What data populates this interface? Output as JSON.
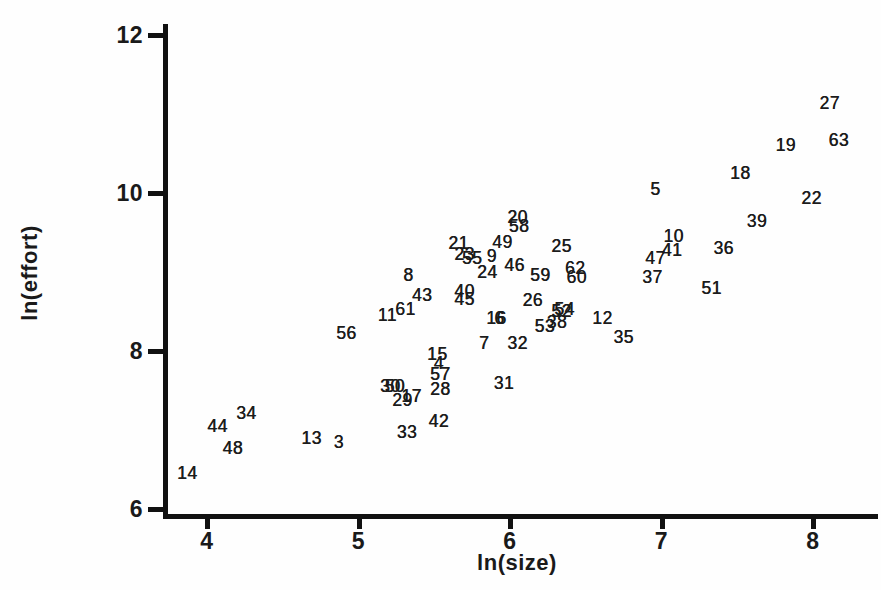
{
  "figure": {
    "background": "#fefefe",
    "ink_color": "#111111",
    "text_color": "#1a1a1a"
  },
  "chart_data": {
    "type": "scatter",
    "title": "",
    "xlabel": "ln(size)",
    "ylabel": "ln(effort)",
    "xlim": [
      3.6,
      8.45
    ],
    "ylim": [
      5.75,
      12.2
    ],
    "x_ticks": [
      4,
      5,
      6,
      7,
      8
    ],
    "y_ticks": [
      6,
      8,
      10,
      12
    ],
    "grid": false,
    "legend": "none",
    "marker_style": "numeric-case-labels",
    "points": [
      {
        "label": "14",
        "x": 3.87,
        "y": 6.46
      },
      {
        "label": "44",
        "x": 4.07,
        "y": 7.05
      },
      {
        "label": "34",
        "x": 4.26,
        "y": 7.22
      },
      {
        "label": "48",
        "x": 4.17,
        "y": 6.77
      },
      {
        "label": "13",
        "x": 4.69,
        "y": 6.9
      },
      {
        "label": "3",
        "x": 4.87,
        "y": 6.85
      },
      {
        "label": "56",
        "x": 4.92,
        "y": 8.23
      },
      {
        "label": "11",
        "x": 5.19,
        "y": 8.46
      },
      {
        "label": "61",
        "x": 5.31,
        "y": 8.53
      },
      {
        "label": "8",
        "x": 5.33,
        "y": 8.96
      },
      {
        "label": "43",
        "x": 5.42,
        "y": 8.71
      },
      {
        "label": "30",
        "x": 5.21,
        "y": 7.56
      },
      {
        "label": "50",
        "x": 5.24,
        "y": 7.56
      },
      {
        "label": "29",
        "x": 5.29,
        "y": 7.38
      },
      {
        "label": "17",
        "x": 5.35,
        "y": 7.43
      },
      {
        "label": "33",
        "x": 5.32,
        "y": 6.97
      },
      {
        "label": "42",
        "x": 5.53,
        "y": 7.11
      },
      {
        "label": "15",
        "x": 5.52,
        "y": 7.96
      },
      {
        "label": "4",
        "x": 5.53,
        "y": 7.85
      },
      {
        "label": "57",
        "x": 5.54,
        "y": 7.71
      },
      {
        "label": "28",
        "x": 5.54,
        "y": 7.52
      },
      {
        "label": "31",
        "x": 5.96,
        "y": 7.59
      },
      {
        "label": "7",
        "x": 5.83,
        "y": 8.1
      },
      {
        "label": "32",
        "x": 6.05,
        "y": 8.1
      },
      {
        "label": "16",
        "x": 5.91,
        "y": 8.42
      },
      {
        "label": "6",
        "x": 5.93,
        "y": 8.42
      },
      {
        "label": "40",
        "x": 5.7,
        "y": 8.76
      },
      {
        "label": "45",
        "x": 5.7,
        "y": 8.66
      },
      {
        "label": "21",
        "x": 5.66,
        "y": 9.37
      },
      {
        "label": "23",
        "x": 5.7,
        "y": 9.23
      },
      {
        "label": "55",
        "x": 5.75,
        "y": 9.18
      },
      {
        "label": "9",
        "x": 5.88,
        "y": 9.2
      },
      {
        "label": "49",
        "x": 5.95,
        "y": 9.38
      },
      {
        "label": "20",
        "x": 6.05,
        "y": 9.7
      },
      {
        "label": "58",
        "x": 6.06,
        "y": 9.58
      },
      {
        "label": "24",
        "x": 5.85,
        "y": 9.0
      },
      {
        "label": "46",
        "x": 6.03,
        "y": 9.09
      },
      {
        "label": "26",
        "x": 6.15,
        "y": 8.65
      },
      {
        "label": "59",
        "x": 6.2,
        "y": 8.96
      },
      {
        "label": "25",
        "x": 6.34,
        "y": 9.33
      },
      {
        "label": "62",
        "x": 6.43,
        "y": 9.05
      },
      {
        "label": "60",
        "x": 6.44,
        "y": 8.94
      },
      {
        "label": "52",
        "x": 6.34,
        "y": 8.51
      },
      {
        "label": "54",
        "x": 6.36,
        "y": 8.53
      },
      {
        "label": "38",
        "x": 6.31,
        "y": 8.37
      },
      {
        "label": "53",
        "x": 6.23,
        "y": 8.32
      },
      {
        "label": "12",
        "x": 6.61,
        "y": 8.42
      },
      {
        "label": "35",
        "x": 6.75,
        "y": 8.18
      },
      {
        "label": "5",
        "x": 6.96,
        "y": 10.05
      },
      {
        "label": "10",
        "x": 7.08,
        "y": 9.46
      },
      {
        "label": "41",
        "x": 7.07,
        "y": 9.28
      },
      {
        "label": "47",
        "x": 6.96,
        "y": 9.18
      },
      {
        "label": "37",
        "x": 6.94,
        "y": 8.94
      },
      {
        "label": "36",
        "x": 7.41,
        "y": 9.3
      },
      {
        "label": "51",
        "x": 7.33,
        "y": 8.8
      },
      {
        "label": "39",
        "x": 7.63,
        "y": 9.65
      },
      {
        "label": "18",
        "x": 7.52,
        "y": 10.25
      },
      {
        "label": "19",
        "x": 7.82,
        "y": 10.61
      },
      {
        "label": "22",
        "x": 7.99,
        "y": 9.94
      },
      {
        "label": "27",
        "x": 8.11,
        "y": 11.14
      },
      {
        "label": "63",
        "x": 8.17,
        "y": 10.67
      }
    ]
  }
}
